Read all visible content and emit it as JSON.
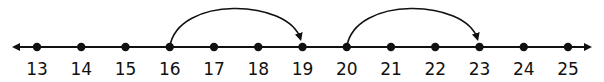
{
  "number_line": {
    "start": 13,
    "end": 25,
    "step": 1,
    "ticks": [
      {
        "value": 13,
        "label": "13"
      },
      {
        "value": 14,
        "label": "14"
      },
      {
        "value": 15,
        "label": "15"
      },
      {
        "value": 16,
        "label": "16"
      },
      {
        "value": 17,
        "label": "17"
      },
      {
        "value": 18,
        "label": "18"
      },
      {
        "value": 19,
        "label": "19"
      },
      {
        "value": 20,
        "label": "20"
      },
      {
        "value": 21,
        "label": "21"
      },
      {
        "value": 22,
        "label": "22"
      },
      {
        "value": 23,
        "label": "23"
      },
      {
        "value": 24,
        "label": "24"
      },
      {
        "value": 25,
        "label": "25"
      }
    ],
    "arrows_both_ends": true,
    "jumps": [
      {
        "from": 16,
        "to": 19
      },
      {
        "from": 20,
        "to": 23
      }
    ],
    "colors": {
      "line": "#111111",
      "dot": "#111111",
      "arc": "#111111",
      "background": "#ffffff"
    }
  }
}
